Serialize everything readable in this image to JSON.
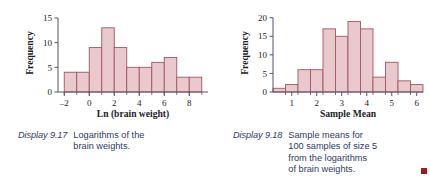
{
  "figures": [
    {
      "id": "display-9-17",
      "caption_label": "Display 9.17",
      "caption_lines": [
        "Logarithms of the",
        "brain weights."
      ],
      "end_marker": false,
      "chart_data": {
        "type": "bar",
        "title": "",
        "xlabel": "Ln (brain weight)",
        "ylabel": "Frequency",
        "xlim": [
          -2.5,
          9.5
        ],
        "ylim": [
          0,
          15.8
        ],
        "xticks": [
          -2,
          0,
          2,
          4,
          6,
          8
        ],
        "xtick_labels": [
          "–2",
          "0",
          "2",
          "4",
          "6",
          "8"
        ],
        "yticks": [
          0,
          5,
          10,
          15
        ],
        "ytick_labels": [
          "0",
          "5",
          "10",
          "15"
        ],
        "bin_width": 1,
        "bin_edges": [
          -2,
          -1,
          0,
          1,
          2,
          3,
          4,
          5,
          6,
          7,
          8,
          9
        ],
        "categories": [
          "-2 to -1",
          "-1 to 0",
          "0 to 1",
          "1 to 2",
          "2 to 3",
          "3 to 4",
          "4 to 5",
          "5 to 6",
          "6 to 7",
          "7 to 8",
          "8 to 9"
        ],
        "values": [
          4,
          4,
          9,
          13,
          9,
          5,
          5,
          6,
          7,
          3,
          3
        ],
        "grid": false,
        "legend": "none",
        "bar_fill": "#e9c9cd",
        "bar_stroke": "#a3555f"
      }
    },
    {
      "id": "display-9-18",
      "caption_label": "Display 9.18",
      "caption_lines": [
        "Sample means for",
        "100 samples of size 5",
        "from the logarithms",
        "of brain weights."
      ],
      "end_marker": true,
      "chart_data": {
        "type": "bar",
        "title": "",
        "xlabel": "Sample Mean",
        "ylabel": "Frequency",
        "xlim": [
          0.25,
          6.25
        ],
        "ylim": [
          0,
          21
        ],
        "xticks": [
          1,
          2,
          3,
          4,
          5,
          6
        ],
        "xtick_labels": [
          "1",
          "2",
          "3",
          "4",
          "5",
          "6"
        ],
        "yticks": [
          0,
          5,
          10,
          15,
          20
        ],
        "ytick_labels": [
          "0",
          "5",
          "10",
          "15",
          "20"
        ],
        "bin_width": 0.5,
        "bin_edges": [
          0.25,
          0.75,
          1.25,
          1.75,
          2.25,
          2.75,
          3.25,
          3.75,
          4.25,
          4.75,
          5.25,
          5.75,
          6.25
        ],
        "categories": [
          "0.25-0.75",
          "0.75-1.25",
          "1.25-1.75",
          "1.75-2.25",
          "2.25-2.75",
          "2.75-3.25",
          "3.25-3.75",
          "3.75-4.25",
          "4.25-4.75",
          "4.75-5.25",
          "5.25-5.75",
          "5.75-6.25"
        ],
        "values": [
          1,
          2,
          6,
          6,
          17,
          15,
          19,
          17,
          4,
          8,
          3,
          2
        ],
        "grid": false,
        "legend": "none",
        "bar_fill": "#e9c9cd",
        "bar_stroke": "#a3555f"
      }
    }
  ],
  "colors": {
    "bar_fill": "#e9c9cd",
    "bar_stroke": "#a3555f",
    "axis": "#55556a",
    "caption_text": "#2f3a63",
    "end_marker": "#9e1b20",
    "background": "#ffffff"
  }
}
